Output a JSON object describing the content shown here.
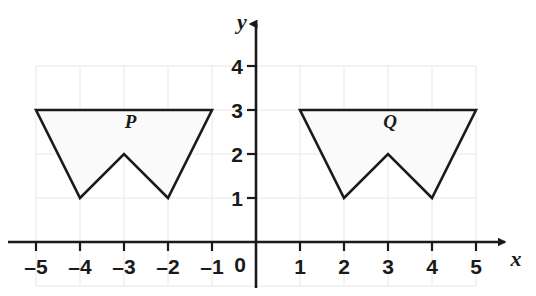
{
  "figure": {
    "type": "coordinate-plane",
    "background_color": "#ffffff",
    "grid": {
      "color": "#e8e8e8",
      "visible": true,
      "x_min": -5,
      "x_max": 5,
      "y_min": -1,
      "y_max": 4
    },
    "axes": {
      "color": "#1a1a1a",
      "x_label": "x",
      "y_label": "y",
      "origin_label": "0",
      "x_ticks": [
        "–5",
        "–4",
        "–3",
        "–2",
        "–1",
        "1",
        "2",
        "3",
        "4",
        "5"
      ],
      "x_tick_values": [
        -5,
        -4,
        -3,
        -2,
        -1,
        1,
        2,
        3,
        4,
        5
      ],
      "y_ticks": [
        "1",
        "2",
        "3",
        "4"
      ],
      "y_tick_values": [
        1,
        2,
        3,
        4
      ]
    },
    "shapes": [
      {
        "label": "P",
        "label_x": -2.85,
        "label_y": 2.6,
        "fill": "#fafafa",
        "stroke": "#1a1a1a",
        "vertices": [
          {
            "x": -5,
            "y": 3
          },
          {
            "x": -1,
            "y": 3
          },
          {
            "x": -2,
            "y": 1
          },
          {
            "x": -3,
            "y": 2
          },
          {
            "x": -4,
            "y": 1
          }
        ]
      },
      {
        "label": "Q",
        "label_x": 3.05,
        "label_y": 2.6,
        "fill": "#fafafa",
        "stroke": "#1a1a1a",
        "vertices": [
          {
            "x": 1,
            "y": 3
          },
          {
            "x": 5,
            "y": 3
          },
          {
            "x": 4,
            "y": 1
          },
          {
            "x": 3,
            "y": 2
          },
          {
            "x": 2,
            "y": 1
          }
        ]
      }
    ]
  },
  "chart_data": {
    "type": "scatter",
    "title": "",
    "xlabel": "x",
    "ylabel": "y",
    "xlim": [
      -5,
      5
    ],
    "ylim": [
      -1,
      4
    ],
    "grid": true,
    "legend": "none",
    "series": [
      {
        "name": "P",
        "closed_polygon": true,
        "x": [
          -5,
          -1,
          -2,
          -3,
          -4
        ],
        "y": [
          3,
          3,
          1,
          2,
          1
        ]
      },
      {
        "name": "Q",
        "closed_polygon": true,
        "x": [
          1,
          5,
          4,
          3,
          2
        ],
        "y": [
          3,
          3,
          1,
          2,
          1
        ]
      }
    ],
    "xticks": [
      -5,
      -4,
      -3,
      -2,
      -1,
      0,
      1,
      2,
      3,
      4,
      5
    ],
    "xticklabels": [
      "–5",
      "–4",
      "–3",
      "–2",
      "–1",
      "0",
      "1",
      "2",
      "3",
      "4",
      "5"
    ],
    "yticks": [
      1,
      2,
      3,
      4
    ],
    "yticklabels": [
      "1",
      "2",
      "3",
      "4"
    ],
    "annotations": [
      {
        "text": "P",
        "x": -2.85,
        "y": 2.6
      },
      {
        "text": "Q",
        "x": 3.05,
        "y": 2.6
      }
    ]
  }
}
